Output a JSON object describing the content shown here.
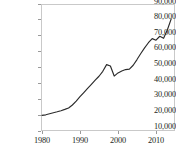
{
  "chart_data": {
    "type": "line",
    "title": "",
    "xlabel": "",
    "ylabel": "",
    "xlim": [
      1980,
      2014
    ],
    "ylim": [
      10000,
      90000
    ],
    "grid": false,
    "legend": false,
    "y_ticks": [
      "90,000",
      "80,000",
      "70,000",
      "60,000",
      "50,000",
      "40,000",
      "30,000",
      "20,000",
      "10,000"
    ],
    "y_tick_values": [
      90000,
      80000,
      70000,
      60000,
      50000,
      40000,
      30000,
      20000,
      10000
    ],
    "x_ticks": [
      "1980",
      "1990",
      "2000",
      "2010"
    ],
    "x_tick_values": [
      1980,
      1990,
      2000,
      2010
    ],
    "series": [
      {
        "name": "",
        "color": "#2b2b2b",
        "x": [
          1980,
          1981,
          1982,
          1983,
          1984,
          1985,
          1986,
          1987,
          1988,
          1989,
          1990,
          1991,
          1992,
          1993,
          1994,
          1995,
          1996,
          1997,
          1998,
          1999,
          2000,
          2001,
          2002,
          2003,
          2004,
          2005,
          2006,
          2007,
          2008,
          2009,
          2010,
          2011,
          2012,
          2013,
          2014
        ],
        "values": [
          19800,
          20200,
          20900,
          21500,
          22100,
          22800,
          23600,
          24500,
          26400,
          28800,
          31600,
          34200,
          36800,
          39400,
          42000,
          44500,
          47600,
          51800,
          50900,
          44600,
          46600,
          47800,
          48700,
          49000,
          51400,
          55000,
          58800,
          62400,
          65600,
          68200,
          67200,
          69700,
          68400,
          73800,
          80600
        ]
      }
    ]
  },
  "axes": {
    "axis_color": "#808080",
    "tick_color": "#9a9a9a",
    "frame_color": "#c9c9c9",
    "text_color": "#231f20"
  }
}
